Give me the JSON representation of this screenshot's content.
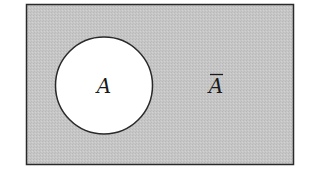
{
  "diagram": {
    "type": "venn",
    "universe": {
      "fill": "#c8c8c8",
      "stroke": "#2a2a2a"
    },
    "set": {
      "label": "A",
      "fill": "#ffffff",
      "stroke": "#2a2a2a"
    },
    "complement": {
      "label": "A",
      "overline": true
    }
  }
}
